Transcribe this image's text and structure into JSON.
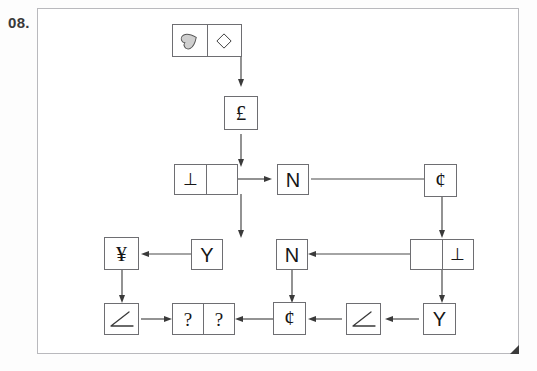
{
  "question_number": "08.",
  "colors": {
    "frame_border": "#b9b9bd",
    "box_border": "#6e6e72",
    "glyph": "#161616",
    "arrow": "#4a4a4a",
    "heart_fill": "#cfcfcf",
    "corner_mark": "#3b3b3b",
    "page_background": "#ffffff"
  },
  "diagram": {
    "type": "flowchart-sequence-puzzle",
    "nodes": [
      {
        "id": "n1",
        "name": "start-shapes-box",
        "cells": [
          {
            "kind": "icon",
            "icon": "heart-icon",
            "label": "heart"
          },
          {
            "kind": "icon",
            "icon": "diamond-icon",
            "label": "diamond"
          }
        ]
      },
      {
        "id": "n2",
        "name": "pound-box",
        "cells": [
          {
            "kind": "text",
            "label": "£"
          }
        ]
      },
      {
        "id": "n3",
        "name": "perp-left-box",
        "cells": [
          {
            "kind": "text",
            "label": "⊥"
          },
          {
            "kind": "text",
            "label": ""
          }
        ]
      },
      {
        "id": "n4",
        "name": "letter-n-box-top",
        "cells": [
          {
            "kind": "text",
            "label": "N"
          }
        ]
      },
      {
        "id": "n5",
        "name": "cent-box-top-right",
        "cells": [
          {
            "kind": "text",
            "label": "¢"
          }
        ]
      },
      {
        "id": "n6",
        "name": "perp-right-box",
        "cells": [
          {
            "kind": "text",
            "label": ""
          },
          {
            "kind": "text",
            "label": "⊥"
          }
        ]
      },
      {
        "id": "n7",
        "name": "letter-n-box-middle",
        "cells": [
          {
            "kind": "text",
            "label": "N"
          }
        ]
      },
      {
        "id": "n8",
        "name": "letter-y-box-middle",
        "cells": [
          {
            "kind": "text",
            "label": "Y"
          }
        ]
      },
      {
        "id": "n9",
        "name": "yen-box",
        "cells": [
          {
            "kind": "text",
            "label": "¥"
          }
        ]
      },
      {
        "id": "n10",
        "name": "angle-box-left",
        "cells": [
          {
            "kind": "icon",
            "icon": "angle-icon",
            "label": "angle"
          }
        ]
      },
      {
        "id": "n11",
        "name": "answer-box",
        "cells": [
          {
            "kind": "text",
            "label": "?"
          },
          {
            "kind": "text",
            "label": "?"
          }
        ]
      },
      {
        "id": "n12",
        "name": "cent-box-bottom",
        "cells": [
          {
            "kind": "text",
            "label": "¢"
          }
        ]
      },
      {
        "id": "n13",
        "name": "angle-box-right",
        "cells": [
          {
            "kind": "icon",
            "icon": "angle-icon",
            "label": "angle"
          }
        ]
      },
      {
        "id": "n14",
        "name": "letter-y-box-right",
        "cells": [
          {
            "kind": "text",
            "label": "Y"
          }
        ]
      }
    ],
    "edges": [
      {
        "from": "n1",
        "to": "n2",
        "direction": "down"
      },
      {
        "from": "n2",
        "to": "n3",
        "direction": "down"
      },
      {
        "from": "n3",
        "to": "n4",
        "direction": "right"
      },
      {
        "from": "n4",
        "to": "n5",
        "direction": "right"
      },
      {
        "from": "n3",
        "to": "n8",
        "direction": "down"
      },
      {
        "from": "n5",
        "to": "n6",
        "direction": "down"
      },
      {
        "from": "n6",
        "to": "n7",
        "direction": "left"
      },
      {
        "from": "n8",
        "to": "n9",
        "direction": "left"
      },
      {
        "from": "n9",
        "to": "n10",
        "direction": "down"
      },
      {
        "from": "n7",
        "to": "n12",
        "direction": "down"
      },
      {
        "from": "n6",
        "to": "n14",
        "direction": "down"
      },
      {
        "from": "n14",
        "to": "n13",
        "direction": "left"
      },
      {
        "from": "n13",
        "to": "n12",
        "direction": "left"
      },
      {
        "from": "n12",
        "to": "n11",
        "direction": "left"
      },
      {
        "from": "n10",
        "to": "n11",
        "direction": "right"
      }
    ]
  }
}
